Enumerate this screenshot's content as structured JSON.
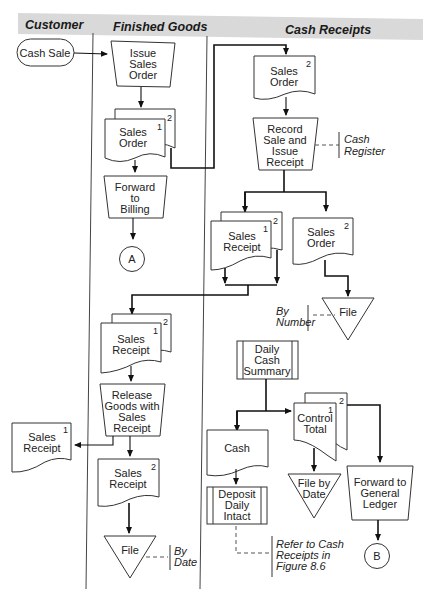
{
  "header": {
    "columns": [
      "Customer",
      "Finished Goods",
      "Cash Receipts"
    ],
    "background": "#d9d9d9"
  },
  "nodes": {
    "cash_sale": "Cash Sale",
    "issue_sales_order": [
      "Issue",
      "Sales",
      "Order"
    ],
    "fg_sales_order": {
      "lines": [
        "Sales",
        "Order"
      ],
      "copies": [
        "1",
        "2"
      ]
    },
    "forward_to_billing": [
      "Forward",
      "to",
      "Billing"
    ],
    "connector_a": "A",
    "cr_sales_order": {
      "lines": [
        "Sales",
        "Order"
      ],
      "copy": "2"
    },
    "record_sale": [
      "Record",
      "Sale and",
      "Issue",
      "Receipt"
    ],
    "cash_register": [
      "Cash",
      "Register"
    ],
    "cr_sales_receipt": {
      "lines": [
        "Sales",
        "Receipt"
      ],
      "copies": [
        "1",
        "2"
      ]
    },
    "cr_sales_order_2": {
      "lines": [
        "Sales",
        "Order"
      ],
      "copy": "2"
    },
    "file_by_number": {
      "label": "File",
      "annotation": [
        "By",
        "Number"
      ]
    },
    "fg_sales_receipt": {
      "lines": [
        "Sales",
        "Receipt"
      ],
      "copies": [
        "1",
        "2"
      ]
    },
    "release_goods": [
      "Release",
      "Goods with",
      "Sales",
      "Receipt"
    ],
    "cust_sales_receipt": {
      "lines": [
        "Sales",
        "Receipt"
      ],
      "copy": "1"
    },
    "fg_sales_receipt_2": {
      "lines": [
        "Sales",
        "Receipt"
      ],
      "copy": "2"
    },
    "file_by_date": {
      "label": "File",
      "annotation": [
        "By",
        "Date"
      ]
    },
    "daily_cash_summary": [
      "Daily",
      "Cash",
      "Summary"
    ],
    "control_total": {
      "lines": [
        "Control",
        "Total"
      ],
      "copies": [
        "1",
        "2"
      ]
    },
    "cash": "Cash",
    "deposit_daily_intact": [
      "Deposit",
      "Daily",
      "Intact"
    ],
    "file_by_date_2": [
      "File by",
      "Date"
    ],
    "forward_to_gl": [
      "Forward to",
      "General",
      "Ledger"
    ],
    "connector_b": "B",
    "refer_note": [
      "Refer to Cash",
      "Receipts in",
      "Figure 8.6"
    ]
  }
}
